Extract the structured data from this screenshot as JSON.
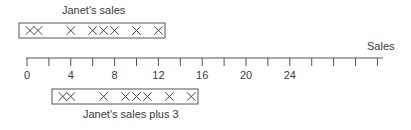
{
  "chart_data": {
    "type": "dot-plot",
    "axis": {
      "label": "Sales",
      "min": 0,
      "max": 32,
      "tick_step": 2,
      "labeled_ticks": [
        0,
        4,
        8,
        12,
        16,
        20,
        24
      ]
    },
    "series": [
      {
        "name": "Janet's sales",
        "values": [
          0,
          1,
          4,
          6,
          7,
          8,
          10,
          12
        ],
        "position": "above"
      },
      {
        "name": "Janet's sales plus 3",
        "values": [
          3,
          4,
          7,
          9,
          10,
          11,
          13,
          15
        ],
        "position": "below"
      }
    ]
  },
  "labels": {
    "top_title": "Janet's sales",
    "bottom_title": "Janet's sales plus 3",
    "axis_title": "Sales",
    "ticks": [
      "0",
      "4",
      "8",
      "12",
      "16",
      "20",
      "24"
    ]
  },
  "colors": {
    "line": "#555555",
    "mark": "#444444"
  }
}
